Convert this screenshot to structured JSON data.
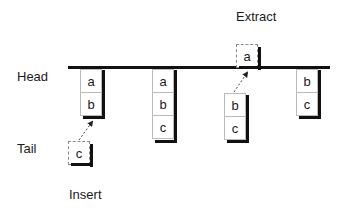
{
  "labels": {
    "head": "Head",
    "tail": "Tail",
    "insert": "Insert",
    "extract": "Extract"
  },
  "stacks": [
    {
      "name": "stack-1",
      "cells": [
        "a",
        "b"
      ]
    },
    {
      "name": "stack-2",
      "cells": [
        "a",
        "b",
        "c"
      ]
    },
    {
      "name": "stack-3",
      "cells": [
        "b",
        "c"
      ]
    },
    {
      "name": "stack-4",
      "cells": [
        "b",
        "c"
      ]
    }
  ],
  "floating": {
    "inserted": "c",
    "extracted": "a"
  }
}
